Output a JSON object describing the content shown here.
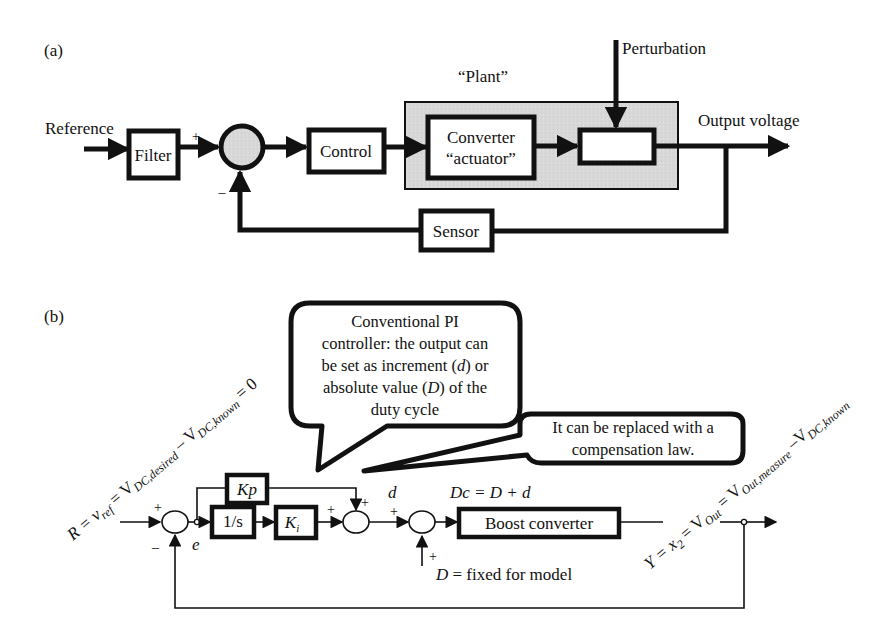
{
  "panel_a": {
    "label": "(a)",
    "reference_label": "Reference",
    "filter_label": "Filter",
    "plus_sign": "+",
    "minus_sign": "–",
    "control_label": "Control",
    "plant_label": "“Plant”",
    "converter_line1": "Converter",
    "converter_line2": "“actuator”",
    "perturbation_label": "Perturbation",
    "output_label": "Output voltage",
    "sensor_label": "Sensor",
    "colors": {
      "plant_fill": "#d9d9d9",
      "summing_fill": "#d4d4d4",
      "line": "#111111"
    }
  },
  "panel_b": {
    "label": "(b)",
    "reference_eq_left": "R = v",
    "reference_eq_ref": "ref",
    "reference_eq_mid": " = V",
    "reference_eq_sub1": "DC,desired",
    "reference_eq_minus": " – V",
    "reference_eq_sub2": "DC,known",
    "reference_eq_end": " = 0",
    "plus_sign": "+",
    "minus_sign": "–",
    "error_label": "e",
    "kp_label": "Kp",
    "integrator_label": "1/s",
    "ki_label": "K",
    "ki_sub": "i",
    "d_label": "d",
    "dc_eq": "Dc = D + d",
    "boost_label": "Boost converter",
    "D_fixed_D": "D",
    "D_fixed_rest": " = fixed for model",
    "output_eq_left": "Y = x",
    "output_eq_sub": "2",
    "output_eq_mid": " = V",
    "output_eq_out": "Out",
    "output_eq_mid2": " = V",
    "output_eq_sub2": "Out,measure",
    "output_eq_minus": " –V",
    "output_eq_sub3": "DC,known",
    "callout_pi": {
      "line1": "Conventional PI",
      "line2": "controller: the output can",
      "line3a": "be set as increment (",
      "line3b": "d",
      "line3c": ") or",
      "line4a": "absolute value (",
      "line4b": "D",
      "line4c": ") of the",
      "line5": "duty cycle"
    },
    "callout_comp": {
      "line1": "It can be replaced with a",
      "line2": "compensation law."
    }
  }
}
